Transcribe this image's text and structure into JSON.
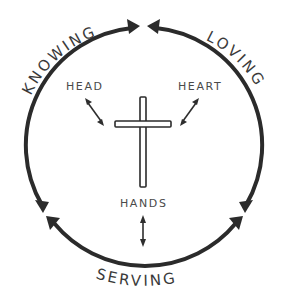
{
  "diagram": {
    "outer_cycle": {
      "labels": {
        "knowing": "KNOWING",
        "loving": "LOVING",
        "serving": "SERVING"
      }
    },
    "inner": {
      "labels": {
        "head": "HEAD",
        "heart": "HEART",
        "hands": "HANDS"
      },
      "center_symbol": "cross"
    },
    "colors": {
      "stroke": "#2b2b2b",
      "text": "#3a3a3a",
      "background": "#ffffff"
    }
  }
}
